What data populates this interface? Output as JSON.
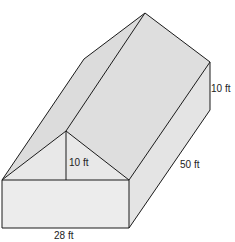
{
  "diagram": {
    "type": "3D building (rectangular prism with triangular prism roof)",
    "colors": {
      "background": "#ffffff",
      "stroke": "#1a1a1a",
      "face_front": "#ececec",
      "face_gable": "#e6e6e6",
      "face_roof_left": "#dcdcdc",
      "face_roof_right": "#dedede",
      "face_side": "#e4e4e4"
    },
    "labels": {
      "gable_height": "10 ft",
      "wall_height": "10 ft",
      "length": "50 ft",
      "width": "28 ft"
    }
  }
}
